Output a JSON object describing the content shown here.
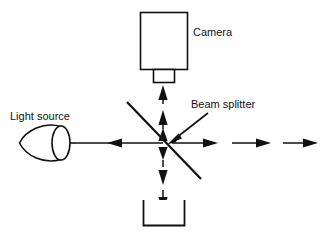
{
  "figure": {
    "type": "optical-schematic",
    "title_visible": false,
    "background_color": "#ffffff",
    "ink_color": "#111111",
    "width": 325,
    "height": 236
  },
  "labels": {
    "camera": "Camera",
    "light_source": "Light source",
    "beam_splitter": "Beam splitter"
  },
  "components": [
    {
      "id": "camera",
      "name": "Camera",
      "shape": "rectangle-with-lens",
      "body": {
        "x": 140,
        "y": 12,
        "width": 48,
        "height": 58
      },
      "lens": {
        "x": 153,
        "y": 70,
        "width": 22,
        "height": 13
      }
    },
    {
      "id": "light-source",
      "name": "Light source",
      "shape": "bulb-dome",
      "bounds": {
        "x": 18,
        "y": 124,
        "width": 54,
        "height": 38
      }
    },
    {
      "id": "beam-splitter",
      "name": "Beam splitter",
      "shape": "diagonal-line",
      "from": {
        "x": 127,
        "y": 102
      },
      "to": {
        "x": 201,
        "y": 179
      }
    },
    {
      "id": "detector-well",
      "name": "Detector",
      "shape": "u-container",
      "bounds": {
        "x": 143,
        "y": 200,
        "width": 42,
        "height": 26
      }
    }
  ],
  "beams": [
    {
      "id": "source-to-splitter",
      "style": "solid",
      "direction": "left",
      "description": "Horizontal beam between light source and beam splitter"
    },
    {
      "id": "splitter-to-camera",
      "style": "dashed",
      "direction": "up",
      "description": "Vertical beam from beam splitter up to camera lens"
    },
    {
      "id": "splitter-to-detector",
      "style": "dashed",
      "direction": "down",
      "description": "Vertical beam from beam splitter down to detector"
    },
    {
      "id": "splitter-outgoing",
      "style": "dashed",
      "direction": "right",
      "description": "Three dashed arrow segments leaving to the right"
    }
  ],
  "annotations": [
    {
      "id": "beam-splitter-pointer",
      "text": "Beam splitter",
      "points_to": {
        "x": 168,
        "y": 142
      },
      "from": {
        "x": 208,
        "y": 113
      }
    }
  ]
}
